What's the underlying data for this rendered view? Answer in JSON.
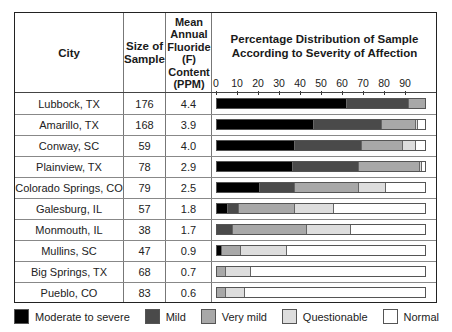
{
  "headers": {
    "city": "City",
    "size": "Size of Sample",
    "fluoride": "Mean Annual Fluoride (F) Content (PPM)",
    "chart_title": "Percentage Distribution of Sample According to Severity of Affection"
  },
  "axis": {
    "ticks": [
      "0",
      "10",
      "20",
      "30",
      "40",
      "50",
      "60",
      "70",
      "80",
      "90"
    ]
  },
  "colors": {
    "moderate_to_severe": "#000000",
    "mild": "#4a4a4a",
    "very_mild": "#a8a8a8",
    "questionable": "#dddddd",
    "normal": "#ffffff"
  },
  "legend": [
    {
      "key": "moderate_to_severe",
      "label": "Moderate to severe"
    },
    {
      "key": "mild",
      "label": "Mild"
    },
    {
      "key": "very_mild",
      "label": "Very mild"
    },
    {
      "key": "questionable",
      "label": "Questionable"
    },
    {
      "key": "normal",
      "label": "Normal"
    }
  ],
  "rows": [
    {
      "city": "Lubbock, TX",
      "size": "176",
      "fluoride": "4.4"
    },
    {
      "city": "Amarillo, TX",
      "size": "168",
      "fluoride": "3.9"
    },
    {
      "city": "Conway, SC",
      "size": "59",
      "fluoride": "4.0"
    },
    {
      "city": "Plainview, TX",
      "size": "78",
      "fluoride": "2.9"
    },
    {
      "city": "Colorado Springs, CO",
      "size": "79",
      "fluoride": "2.5"
    },
    {
      "city": "Galesburg, IL",
      "size": "57",
      "fluoride": "1.8"
    },
    {
      "city": "Monmouth, IL",
      "size": "38",
      "fluoride": "1.7"
    },
    {
      "city": "Mullins, SC",
      "size": "47",
      "fluoride": "0.9"
    },
    {
      "city": "Big Springs, TX",
      "size": "68",
      "fluoride": "0.7"
    },
    {
      "city": "Pueblo, CO",
      "size": "83",
      "fluoride": "0.6"
    }
  ],
  "chart_data": {
    "type": "bar",
    "orientation": "horizontal",
    "stacked": true,
    "title": "Percentage Distribution of Sample According to Severity of Affection",
    "xlabel": "",
    "ylabel": "City",
    "xlim": [
      0,
      100
    ],
    "xticks": [
      0,
      10,
      20,
      30,
      40,
      50,
      60,
      70,
      80,
      90
    ],
    "grid": false,
    "legend_position": "bottom",
    "categories": [
      "Lubbock, TX",
      "Amarillo, TX",
      "Conway, SC",
      "Plainview, TX",
      "Colorado Springs, CO",
      "Galesburg, IL",
      "Monmouth, IL",
      "Mullins, SC",
      "Big Springs, TX",
      "Pueblo, CO"
    ],
    "table_columns": {
      "Size of Sample": [
        176,
        168,
        59,
        78,
        79,
        57,
        38,
        47,
        68,
        83
      ],
      "Mean Annual Fluoride (F) Content (PPM)": [
        4.4,
        3.9,
        4.0,
        2.9,
        2.5,
        1.8,
        1.7,
        0.9,
        0.7,
        0.6
      ]
    },
    "series": [
      {
        "name": "Moderate to severe",
        "values": [
          62,
          46,
          37,
          36,
          20,
          5,
          0,
          2,
          0,
          0
        ]
      },
      {
        "name": "Mild",
        "values": [
          30,
          33,
          32,
          32,
          17,
          5,
          7,
          0,
          0,
          0
        ]
      },
      {
        "name": "Very mild",
        "values": [
          8,
          16,
          20,
          29,
          31,
          27,
          36,
          9,
          4,
          4
        ]
      },
      {
        "name": "Questionable",
        "values": [
          0,
          1,
          6,
          1,
          13,
          19,
          21,
          22,
          12,
          9
        ]
      },
      {
        "name": "Normal",
        "values": [
          0,
          4,
          5,
          2,
          19,
          44,
          36,
          67,
          84,
          87
        ]
      }
    ]
  }
}
